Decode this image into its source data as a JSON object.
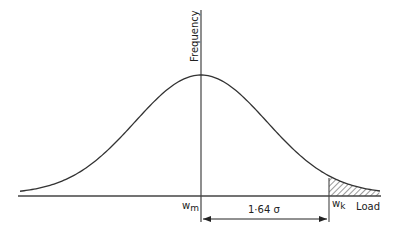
{
  "diagram": {
    "type": "normal-distribution",
    "y_axis_label": "Frequency",
    "x_axis_label": "Load",
    "mean_label": "w",
    "mean_subscript": "m",
    "characteristic_label": "w",
    "characteristic_subscript": "k",
    "distance_label": "1·64 σ",
    "shaded_region": "upper tail beyond w_k (hatched)",
    "colors": {
      "line": "#333333",
      "background": "#ffffff"
    }
  }
}
